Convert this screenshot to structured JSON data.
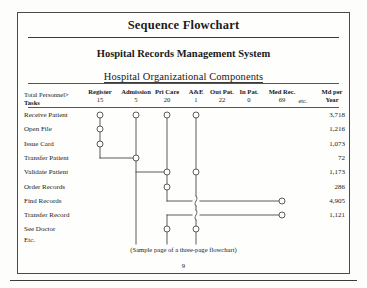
{
  "document": {
    "title": "Sequence Flowchart",
    "system_title": "Hospital Records Management System",
    "subtitle": "Hospital Organizational Components",
    "caption": "(Sample page of a three-page flowchart)",
    "page_number": "9"
  },
  "table": {
    "corner_label_line1": "Total Personnel>",
    "corner_label_line2": "Tasks",
    "md_header_line1": "Md per",
    "md_header_line2": "Year",
    "etc_label": "etc.",
    "columns": [
      {
        "name": "Register",
        "count": "15",
        "x": 100
      },
      {
        "name": "Admission",
        "count": "5",
        "x": 136
      },
      {
        "name": "Pri Care",
        "count": "20",
        "x": 167
      },
      {
        "name": "A&E",
        "count": "1",
        "x": 196
      },
      {
        "name": "Out Pat.",
        "count": "22",
        "x": 222
      },
      {
        "name": "In Pat.",
        "count": "0",
        "x": 249
      },
      {
        "name": "Med Rec.",
        "count": "69",
        "x": 282
      }
    ],
    "rows": [
      {
        "task": "Receive Patient",
        "md_per_year": "3,718",
        "y": 115
      },
      {
        "task": "Open File",
        "md_per_year": "1,216",
        "y": 129
      },
      {
        "task": "Issue Card",
        "md_per_year": "1,073",
        "y": 144
      },
      {
        "task": "Transfer Patient",
        "md_per_year": "72",
        "y": 158
      },
      {
        "task": "Validate Patient",
        "md_per_year": "1,173",
        "y": 172
      },
      {
        "task": "Order Records",
        "md_per_year": "286",
        "y": 187
      },
      {
        "task": "Find Records",
        "md_per_year": "4,905",
        "y": 201
      },
      {
        "task": "Transfer Record",
        "md_per_year": "1,121",
        "y": 215
      },
      {
        "task": "See Doctor",
        "md_per_year": "",
        "y": 229
      },
      {
        "task": "Etc.",
        "md_per_year": "",
        "y": 240
      }
    ]
  },
  "chart_data": {
    "type": "diagram",
    "title": "Sequence Flowchart",
    "nodes": [
      {
        "column": "Register",
        "task": "Receive Patient",
        "x": 100,
        "y": 115
      },
      {
        "column": "Register",
        "task": "Open File",
        "x": 100,
        "y": 129
      },
      {
        "column": "Register",
        "task": "Issue Card",
        "x": 100,
        "y": 144
      },
      {
        "column": "Admission",
        "task": "Receive Patient",
        "x": 136,
        "y": 115
      },
      {
        "column": "Admission",
        "task": "Transfer Patient",
        "x": 136,
        "y": 158
      },
      {
        "column": "Pri Care",
        "task": "Receive Patient",
        "x": 167,
        "y": 115
      },
      {
        "column": "Pri Care",
        "task": "Validate Patient",
        "x": 167,
        "y": 172
      },
      {
        "column": "Pri Care",
        "task": "Order Records",
        "x": 167,
        "y": 187
      },
      {
        "column": "Pri Care",
        "task": "See Doctor",
        "x": 167,
        "y": 229
      },
      {
        "column": "A&E",
        "task": "Receive Patient",
        "x": 196,
        "y": 115
      },
      {
        "column": "A&E",
        "task": "Validate Patient",
        "x": 196,
        "y": 172
      },
      {
        "column": "A&E",
        "task": "See Doctor",
        "x": 196,
        "y": 229
      },
      {
        "column": "Med Rec.",
        "task": "Find Records",
        "x": 282,
        "y": 201
      },
      {
        "column": "Med Rec.",
        "task": "Transfer Record",
        "x": 282,
        "y": 215
      }
    ],
    "connectors": [
      "Register column vertical from Receive Patient down to Transfer Patient row, then right to Admission node",
      "Admission vertical continues down to See Doctor row",
      "Admission to Pri Care horizontal at Validate Patient row",
      "Pri Care vertical from Receive Patient down through Validate Patient and Order Records",
      "Pri Care down to Find Records row then right, crossing A&E vertical, to Med Rec. node",
      "Pri Care vertical continues to See Doctor row",
      "A&E vertical from Receive Patient down through Validate Patient to Transfer Record row, then right to Med Rec. node",
      "A&E vertical continues down to See Doctor row"
    ]
  }
}
